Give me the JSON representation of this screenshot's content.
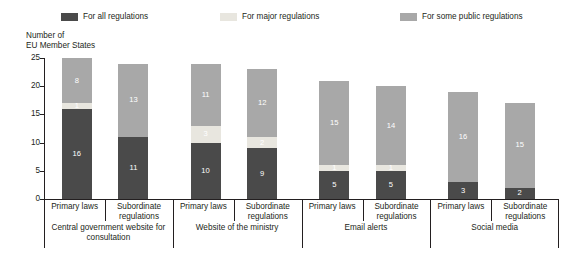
{
  "chart_data": {
    "type": "bar",
    "subtype": "stacked-bar-grouped",
    "title": "",
    "ylabel": "Number of\nEU Member States",
    "xlabel": "",
    "ylim": [
      0,
      25
    ],
    "yticks": [
      0,
      5,
      10,
      15,
      20,
      25
    ],
    "grid": false,
    "legend_position": "top",
    "colors": {
      "all_regulations": "#4a4a4a",
      "major_regulations": "#e8e6df",
      "some_public_regulations": "#a8a8a8",
      "axis": "#231f20",
      "background": "#ffffff",
      "label_text": "#ffffff"
    },
    "legend": [
      {
        "label": "For all regulations",
        "color": "#4a4a4a",
        "key": "all_regulations"
      },
      {
        "label": "For major regulations",
        "color": "#e8e6df",
        "key": "major_regulations"
      },
      {
        "label": "For some public regulations",
        "color": "#a8a8a8",
        "key": "some_public_regulations"
      }
    ],
    "series": [
      {
        "name": "For all regulations",
        "values": [
          16,
          11,
          10,
          9,
          5,
          5,
          3,
          2
        ]
      },
      {
        "name": "For major regulations",
        "values": [
          1,
          0,
          3,
          2,
          1,
          1,
          0,
          0
        ]
      },
      {
        "name": "For some public regulations",
        "values": [
          8,
          13,
          11,
          12,
          15,
          14,
          16,
          15
        ]
      }
    ],
    "categories": [
      "Primary laws",
      "Subordinate regulations",
      "Primary laws",
      "Subordinate regulations",
      "Primary laws",
      "Subordinate regulations",
      "Primary laws",
      "Subordinate regulations"
    ],
    "totals": [
      25,
      24,
      24,
      23,
      21,
      20,
      19,
      17
    ],
    "groups": [
      {
        "label": "Central government website for consultation",
        "bars": [
          0,
          1
        ]
      },
      {
        "label": "Website of the ministry",
        "bars": [
          2,
          3
        ]
      },
      {
        "label": "Email alerts",
        "bars": [
          4,
          5
        ]
      },
      {
        "label": "Social media",
        "bars": [
          6,
          7
        ]
      }
    ]
  },
  "bars": [
    {
      "category": "Primary laws",
      "group": "Central government website for consultation",
      "total": 25,
      "segments": [
        {
          "series": "For all regulations",
          "value": 16,
          "label": "16"
        },
        {
          "series": "For major regulations",
          "value": 1,
          "label": "1"
        },
        {
          "series": "For some public regulations",
          "value": 8,
          "label": "8"
        }
      ]
    },
    {
      "category": "Subordinate regulations",
      "group": "Central government website for consultation",
      "total": 24,
      "segments": [
        {
          "series": "For all regulations",
          "value": 11,
          "label": "11"
        },
        {
          "series": "For major regulations",
          "value": 0,
          "label": ""
        },
        {
          "series": "For some public regulations",
          "value": 13,
          "label": "13"
        }
      ]
    },
    {
      "category": "Primary laws",
      "group": "Website of the ministry",
      "total": 24,
      "segments": [
        {
          "series": "For all regulations",
          "value": 10,
          "label": "10"
        },
        {
          "series": "For major regulations",
          "value": 3,
          "label": "3"
        },
        {
          "series": "For some public regulations",
          "value": 11,
          "label": "11"
        }
      ]
    },
    {
      "category": "Subordinate regulations",
      "group": "Website of the ministry",
      "total": 23,
      "segments": [
        {
          "series": "For all regulations",
          "value": 9,
          "label": "9"
        },
        {
          "series": "For major regulations",
          "value": 2,
          "label": "2"
        },
        {
          "series": "For some public regulations",
          "value": 12,
          "label": "12"
        }
      ]
    },
    {
      "category": "Primary laws",
      "group": "Email alerts",
      "total": 21,
      "segments": [
        {
          "series": "For all regulations",
          "value": 5,
          "label": "5"
        },
        {
          "series": "For major regulations",
          "value": 1,
          "label": "1"
        },
        {
          "series": "For some public regulations",
          "value": 15,
          "label": "15"
        }
      ]
    },
    {
      "category": "Subordinate regulations",
      "group": "Email alerts",
      "total": 20,
      "segments": [
        {
          "series": "For all regulations",
          "value": 5,
          "label": "5"
        },
        {
          "series": "For major regulations",
          "value": 1,
          "label": "1"
        },
        {
          "series": "For some public regulations",
          "value": 14,
          "label": "14"
        }
      ]
    },
    {
      "category": "Primary laws",
      "group": "Social media",
      "total": 19,
      "segments": [
        {
          "series": "For all regulations",
          "value": 3,
          "label": "3"
        },
        {
          "series": "For major regulations",
          "value": 0,
          "label": ""
        },
        {
          "series": "For some public regulations",
          "value": 16,
          "label": "16"
        }
      ]
    },
    {
      "category": "Subordinate regulations",
      "group": "Social media",
      "total": 17,
      "segments": [
        {
          "series": "For all regulations",
          "value": 2,
          "label": "2"
        },
        {
          "series": "For major regulations",
          "value": 0,
          "label": ""
        },
        {
          "series": "For some public regulations",
          "value": 15,
          "label": "15"
        }
      ]
    }
  ]
}
